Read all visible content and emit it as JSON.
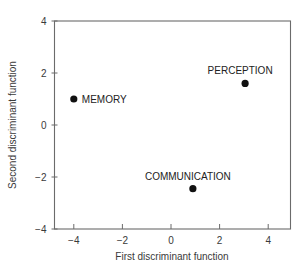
{
  "chart_data": {
    "type": "scatter",
    "title": "",
    "xlabel": "First discriminant function",
    "ylabel": "Second discriminant function",
    "xlim": [
      -4.8,
      4.9
    ],
    "ylim": [
      -4,
      4
    ],
    "xticks": [
      -4,
      -2,
      0,
      2,
      4
    ],
    "yticks": [
      -4,
      -2,
      0,
      2,
      4
    ],
    "xtick_labels": [
      "−4",
      "−2",
      "0",
      "2",
      "4"
    ],
    "ytick_labels": [
      "−4",
      "−2",
      "0",
      "2",
      "4"
    ],
    "grid": false,
    "legend": null,
    "points": [
      {
        "label": "MEMORY",
        "x": -4.0,
        "y": 1.0,
        "label_position": "right"
      },
      {
        "label": "PERCEPTION",
        "x": 3.05,
        "y": 1.6,
        "label_position": "above"
      },
      {
        "label": "COMMUNICATION",
        "x": 0.9,
        "y": -2.45,
        "label_position": "above"
      }
    ],
    "marker_color": "#111111"
  }
}
